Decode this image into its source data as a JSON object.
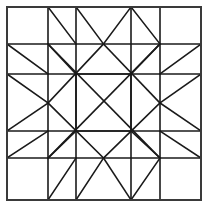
{
  "figure": {
    "kind": "line-diagram",
    "width": 209,
    "height": 207,
    "background_color": "#ffffff",
    "stroke_color": "#1a1a1a",
    "border_stroke_color": "#3a3a3a",
    "stroke_width": 1.6,
    "border_stroke_width": 2.0
  },
  "geometry": {
    "grid_x": [
      7,
      48,
      76,
      103.5,
      131,
      160,
      201
    ],
    "grid_y": [
      7,
      44,
      74,
      103,
      131,
      158,
      200
    ],
    "border": {
      "x1": 7,
      "y1": 7,
      "x2": 201,
      "y2": 200
    },
    "description": "Eight-pointed star medallion centered in a square, framed by sawtooth triangle bands on all four sides, drawn on a nested square grid."
  },
  "segments": {
    "border": [
      [
        7,
        7,
        201,
        7
      ],
      [
        201,
        7,
        201,
        200
      ],
      [
        201,
        200,
        7,
        200
      ],
      [
        7,
        200,
        7,
        7
      ]
    ],
    "grid_horizontal": [
      [
        7,
        44,
        201,
        44
      ],
      [
        7,
        74,
        201,
        74
      ],
      [
        7,
        131,
        201,
        131
      ],
      [
        7,
        158,
        201,
        158
      ]
    ],
    "grid_vertical": [
      [
        48,
        7,
        48,
        200
      ],
      [
        76,
        7,
        76,
        200
      ],
      [
        131,
        7,
        131,
        200
      ],
      [
        160,
        7,
        160,
        200
      ]
    ],
    "inner_square": [
      [
        76,
        74,
        131,
        74
      ],
      [
        131,
        74,
        131,
        131
      ],
      [
        131,
        131,
        76,
        131
      ],
      [
        76,
        131,
        76,
        74
      ]
    ],
    "star_diamond": [
      [
        103.5,
        44,
        160,
        103
      ],
      [
        160,
        103,
        103.5,
        158
      ],
      [
        103.5,
        158,
        48,
        103
      ],
      [
        48,
        103,
        103.5,
        44
      ]
    ],
    "long_diagonals": [
      [
        48,
        44,
        160,
        158
      ],
      [
        160,
        44,
        48,
        158
      ]
    ],
    "top_band_sawtooth": [
      [
        76,
        7,
        103.5,
        44
      ],
      [
        103.5,
        44,
        131,
        7
      ],
      [
        48,
        7,
        76,
        44
      ],
      [
        131,
        7,
        160,
        44
      ]
    ],
    "bottom_band_sawtooth": [
      [
        76,
        200,
        103.5,
        158
      ],
      [
        103.5,
        158,
        131,
        200
      ],
      [
        48,
        200,
        76,
        158
      ],
      [
        131,
        200,
        160,
        158
      ]
    ],
    "left_band_sawtooth": [
      [
        7,
        74,
        48,
        103
      ],
      [
        48,
        103,
        7,
        131
      ],
      [
        7,
        44,
        48,
        74
      ],
      [
        7,
        158,
        48,
        131
      ]
    ],
    "right_band_sawtooth": [
      [
        201,
        74,
        160,
        103
      ],
      [
        160,
        103,
        201,
        131
      ],
      [
        201,
        44,
        160,
        74
      ],
      [
        201,
        158,
        160,
        131
      ]
    ],
    "corner_diagonals": [
      [
        48,
        44,
        76,
        74
      ],
      [
        160,
        44,
        131,
        74
      ],
      [
        48,
        158,
        76,
        131
      ],
      [
        160,
        158,
        131,
        131
      ]
    ]
  }
}
